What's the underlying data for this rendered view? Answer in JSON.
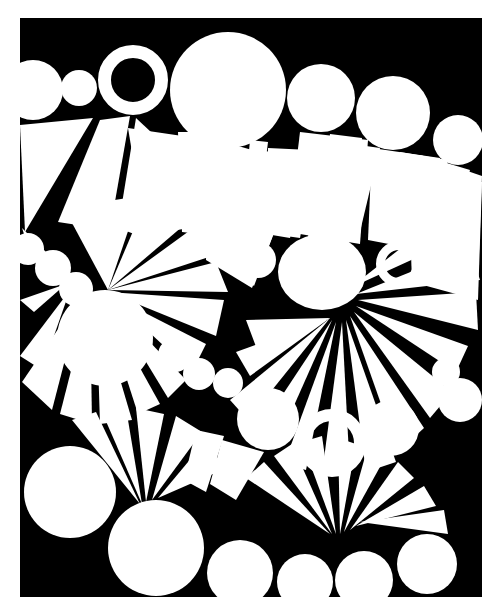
{
  "artwork": {
    "title": "Untitled Abstract Composition",
    "medium": "Black and white graphic print",
    "style": "geometric-abstract",
    "canvas": {
      "width": 503,
      "height": 614
    },
    "palette": {
      "background": "#ffffff",
      "field": "#000000",
      "shapes": "#ffffff"
    },
    "field_rect": {
      "x": 20,
      "y": 18,
      "width": 462,
      "height": 579
    },
    "description": "A black rectangular field filled with white circles, ring shapes and radiating triangular fan wedges, framed by a thin white margin."
  },
  "shapes": {
    "circles": [
      {
        "name": "circle-top-left-edge",
        "cx": 33,
        "cy": 90,
        "r": 30
      },
      {
        "name": "circle-top-small-a",
        "cx": 79,
        "cy": 88,
        "r": 18
      },
      {
        "name": "circle-top-large",
        "cx": 228,
        "cy": 90,
        "r": 58
      },
      {
        "name": "circle-top-right-a",
        "cx": 321,
        "cy": 98,
        "r": 34
      },
      {
        "name": "circle-top-right-b",
        "cx": 393,
        "cy": 113,
        "r": 37
      },
      {
        "name": "circle-top-right-c",
        "cx": 458,
        "cy": 140,
        "r": 25
      },
      {
        "name": "circle-mid-left-a",
        "cx": 28,
        "cy": 249,
        "r": 16
      },
      {
        "name": "circle-mid-left-b",
        "cx": 53,
        "cy": 268,
        "r": 18
      },
      {
        "name": "circle-mid-left-c",
        "cx": 76,
        "cy": 289,
        "r": 17
      },
      {
        "name": "circle-mid-left-large",
        "cx": 105,
        "cy": 338,
        "r": 48
      },
      {
        "name": "circle-mid-center-a",
        "cx": 231,
        "cy": 253,
        "r": 17
      },
      {
        "name": "circle-mid-center-b",
        "cx": 258,
        "cy": 260,
        "r": 18
      },
      {
        "name": "circle-mid-oval-large",
        "cx": 322,
        "cy": 272,
        "rx": 44,
        "ry": 38
      },
      {
        "name": "circle-mid-small-a",
        "cx": 175,
        "cy": 355,
        "r": 17
      },
      {
        "name": "circle-mid-small-b",
        "cx": 199,
        "cy": 374,
        "r": 16
      },
      {
        "name": "circle-mid-small-c",
        "cx": 228,
        "cy": 383,
        "r": 15
      },
      {
        "name": "circle-mid-right-a",
        "cx": 268,
        "cy": 419,
        "r": 31
      },
      {
        "name": "circle-mid-right-b",
        "cx": 391,
        "cy": 428,
        "r": 28
      },
      {
        "name": "circle-mid-right-c",
        "cx": 446,
        "cy": 372,
        "r": 14
      },
      {
        "name": "circle-mid-right-d",
        "cx": 460,
        "cy": 400,
        "r": 22
      },
      {
        "name": "circle-low-left-large",
        "cx": 70,
        "cy": 492,
        "r": 46
      },
      {
        "name": "circle-low-center",
        "cx": 156,
        "cy": 548,
        "r": 48
      },
      {
        "name": "circle-bottom-a",
        "cx": 240,
        "cy": 573,
        "r": 33
      },
      {
        "name": "circle-bottom-b",
        "cx": 305,
        "cy": 582,
        "r": 28
      },
      {
        "name": "circle-bottom-c",
        "cx": 364,
        "cy": 580,
        "r": 29
      },
      {
        "name": "circle-bottom-d",
        "cx": 427,
        "cy": 564,
        "r": 30
      }
    ],
    "rings": [
      {
        "name": "ring-top-left",
        "cx": 133,
        "cy": 80,
        "r_outer": 35,
        "r_inner": 22
      },
      {
        "name": "ring-mid-right",
        "cx": 399,
        "cy": 264,
        "r_outer": 23,
        "r_inner": 14
      },
      {
        "name": "ring-low-center",
        "cx": 332,
        "cy": 443,
        "r_outer": 34,
        "r_inner": 22
      }
    ],
    "fans": [
      {
        "name": "fan-upper-left",
        "pivot_x": 100,
        "pivot_y": 218,
        "wedges": 4
      },
      {
        "name": "fan-upper-center",
        "pivot_x": 245,
        "pivot_y": 300,
        "wedges": 4
      },
      {
        "name": "fan-upper-right",
        "pivot_x": 345,
        "pivot_y": 230,
        "wedges": 5
      },
      {
        "name": "fan-right-edge",
        "pivot_x": 430,
        "pivot_y": 300,
        "wedges": 3
      },
      {
        "name": "fan-mid-left",
        "pivot_x": 108,
        "pivot_y": 290,
        "wedges": 7
      },
      {
        "name": "fan-mid-right",
        "pivot_x": 330,
        "pivot_y": 320,
        "wedges": 7
      },
      {
        "name": "fan-lower-left",
        "pivot_x": 140,
        "pivot_y": 500,
        "wedges": 5
      },
      {
        "name": "fan-lower-right",
        "pivot_x": 330,
        "pivot_y": 530,
        "wedges": 7
      }
    ],
    "counts": {
      "circles": 26,
      "rings": 3,
      "fans": 8
    }
  }
}
